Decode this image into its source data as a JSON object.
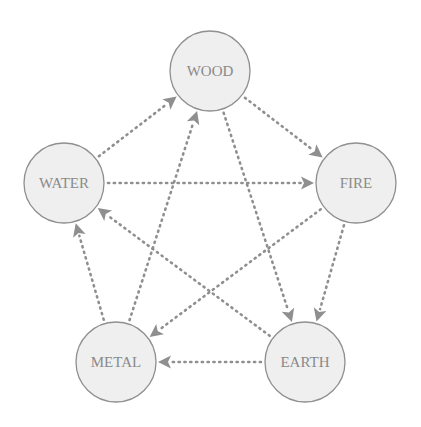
{
  "diagram": {
    "colors": {
      "node_fill": "#efefef",
      "node_stroke": "#8f8f8f",
      "edge": "#8f8f8f",
      "label": "#8a8a8a"
    },
    "nodes": [
      {
        "id": "wood",
        "label": "WOOD",
        "cx": 210,
        "cy": 71,
        "r": 40
      },
      {
        "id": "fire",
        "label": "FIRE",
        "cx": 356,
        "cy": 183,
        "r": 40
      },
      {
        "id": "earth",
        "label": "EARTH",
        "cx": 305,
        "cy": 362,
        "r": 40
      },
      {
        "id": "metal",
        "label": "METAL",
        "cx": 116,
        "cy": 362,
        "r": 40
      },
      {
        "id": "water",
        "label": "WATER",
        "cx": 64,
        "cy": 183,
        "r": 40
      }
    ],
    "generating_cycle": [
      {
        "from": "wood",
        "to": "fire"
      },
      {
        "from": "fire",
        "to": "earth"
      },
      {
        "from": "earth",
        "to": "metal"
      },
      {
        "from": "metal",
        "to": "water"
      },
      {
        "from": "water",
        "to": "wood"
      }
    ],
    "controlling_cycle": [
      {
        "from": "wood",
        "to": "earth"
      },
      {
        "from": "earth",
        "to": "water"
      },
      {
        "from": "water",
        "to": "fire"
      },
      {
        "from": "fire",
        "to": "metal"
      },
      {
        "from": "metal",
        "to": "wood"
      }
    ]
  }
}
